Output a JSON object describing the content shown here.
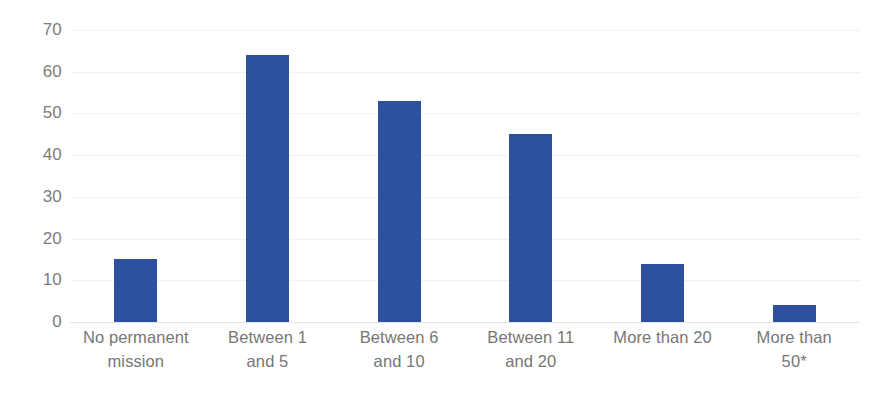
{
  "chart_data": {
    "type": "bar",
    "title": "",
    "subtitle": "",
    "xlabel": "",
    "ylabel": "",
    "categories": [
      "No permanent mission",
      "Between 1 and 5",
      "Between 6 and 10",
      "Between 11 and 20",
      "More than 20",
      "More than 50*"
    ],
    "category_lines": [
      [
        "No permanent",
        "mission"
      ],
      [
        "Between 1",
        "and 5"
      ],
      [
        "Between 6",
        "and 10"
      ],
      [
        "Between 11",
        "and 20"
      ],
      [
        "More than 20",
        ""
      ],
      [
        "More than",
        "50*"
      ]
    ],
    "values": [
      15,
      64,
      53,
      45,
      14,
      4
    ],
    "ylim": [
      0,
      70
    ],
    "y_ticks": [
      0,
      10,
      20,
      30,
      40,
      50,
      60,
      70
    ],
    "y_tick_labels": [
      "0",
      "10",
      "20",
      "30",
      "40",
      "50",
      "60",
      "70"
    ],
    "grid": true,
    "legend": false,
    "legend_position": "none",
    "bar_color": "#2e50a0",
    "gridline_color": "#f2f2f2",
    "axis_color": "#e3e3e3",
    "tick_label_color": "#7d7d7d",
    "background_color": "#ffffff"
  }
}
